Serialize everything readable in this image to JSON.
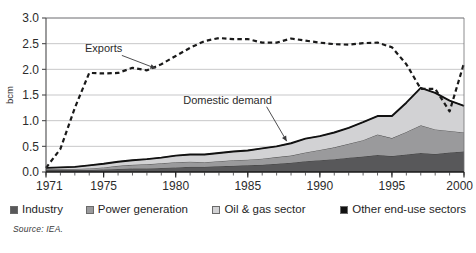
{
  "figure": {
    "source_note": "Source: IEA.",
    "title_partial": ""
  },
  "legend": {
    "items": [
      {
        "label": "Industry",
        "color": "#58585a",
        "swatch_name": "legend-swatch-industry"
      },
      {
        "label": "Power generation",
        "color": "#9a9a9c",
        "swatch_name": "legend-swatch-power-generation"
      },
      {
        "label": "Oil & gas sector",
        "color": "#d2d2d4",
        "swatch_name": "legend-swatch-oil-gas-sector"
      },
      {
        "label": "Other end-use sectors",
        "color": "#111111",
        "swatch_name": "legend-swatch-other-end-use"
      }
    ]
  },
  "chart_data": {
    "type": "area",
    "title": "",
    "xlabel": "",
    "ylabel": "bcm",
    "ylim": [
      0,
      3.0
    ],
    "xlim": [
      1971,
      2000
    ],
    "yticks": [
      "0.0",
      "0.5",
      "1.0",
      "1.5",
      "2.0",
      "2.5",
      "3.0"
    ],
    "ytick_values": [
      0.0,
      0.5,
      1.0,
      1.5,
      2.0,
      2.5,
      3.0
    ],
    "xticks": [
      "1971",
      "1975",
      "1980",
      "1985",
      "1990",
      "1995",
      "2000"
    ],
    "xtick_values": [
      1971,
      1975,
      1980,
      1985,
      1990,
      1995,
      2000
    ],
    "grid": "horizontal",
    "legend_position": "below",
    "stacked": true,
    "x": [
      1971,
      1972,
      1973,
      1974,
      1975,
      1976,
      1977,
      1978,
      1979,
      1980,
      1981,
      1982,
      1983,
      1984,
      1985,
      1986,
      1987,
      1988,
      1989,
      1990,
      1991,
      1992,
      1993,
      1994,
      1995,
      1996,
      1997,
      1998,
      1999,
      2000
    ],
    "series": [
      {
        "name": "Other end-use sectors",
        "color": "#111111",
        "values": [
          0.01,
          0.01,
          0.01,
          0.01,
          0.01,
          0.01,
          0.01,
          0.01,
          0.01,
          0.01,
          0.01,
          0.01,
          0.01,
          0.01,
          0.01,
          0.01,
          0.01,
          0.01,
          0.01,
          0.01,
          0.01,
          0.01,
          0.01,
          0.01,
          0.01,
          0.01,
          0.01,
          0.01,
          0.01,
          0.01
        ]
      },
      {
        "name": "Industry",
        "color": "#58585a",
        "values": [
          0.03,
          0.03,
          0.03,
          0.03,
          0.04,
          0.05,
          0.06,
          0.06,
          0.07,
          0.08,
          0.09,
          0.09,
          0.1,
          0.11,
          0.12,
          0.13,
          0.15,
          0.17,
          0.2,
          0.22,
          0.24,
          0.27,
          0.29,
          0.32,
          0.3,
          0.33,
          0.36,
          0.34,
          0.37,
          0.39
        ]
      },
      {
        "name": "Power generation",
        "color": "#9a9a9c",
        "values": [
          0.02,
          0.02,
          0.02,
          0.03,
          0.04,
          0.06,
          0.07,
          0.08,
          0.09,
          0.1,
          0.1,
          0.09,
          0.1,
          0.11,
          0.11,
          0.12,
          0.13,
          0.14,
          0.17,
          0.2,
          0.23,
          0.27,
          0.32,
          0.4,
          0.35,
          0.44,
          0.54,
          0.48,
          0.42,
          0.37
        ]
      },
      {
        "name": "Oil & gas sector",
        "color": "#d2d2d4",
        "values": [
          0.02,
          0.03,
          0.04,
          0.06,
          0.07,
          0.08,
          0.09,
          0.1,
          0.11,
          0.13,
          0.14,
          0.15,
          0.16,
          0.17,
          0.18,
          0.2,
          0.21,
          0.24,
          0.27,
          0.27,
          0.29,
          0.31,
          0.35,
          0.36,
          0.43,
          0.57,
          0.73,
          0.71,
          0.59,
          0.52
        ]
      }
    ],
    "total_domestic_demand": [
      0.08,
      0.09,
      0.1,
      0.13,
      0.16,
      0.2,
      0.23,
      0.25,
      0.28,
      0.32,
      0.34,
      0.34,
      0.37,
      0.4,
      0.42,
      0.46,
      0.5,
      0.56,
      0.65,
      0.7,
      0.77,
      0.86,
      0.97,
      1.09,
      1.09,
      1.35,
      1.64,
      1.54,
      1.39,
      1.29
    ],
    "exports_line": {
      "name": "Exports",
      "style": "dashed",
      "color": "#1a1a1a",
      "values": [
        0.08,
        0.45,
        1.25,
        1.93,
        1.92,
        1.93,
        2.03,
        1.98,
        2.1,
        2.26,
        2.42,
        2.55,
        2.61,
        2.59,
        2.59,
        2.52,
        2.52,
        2.6,
        2.56,
        2.52,
        2.49,
        2.48,
        2.51,
        2.52,
        2.43,
        2.1,
        1.62,
        1.62,
        1.18,
        2.12
      ]
    },
    "annotations": [
      {
        "text": "Exports",
        "x": 1975.0,
        "y": 2.33,
        "arrow_to_x": 1978.6,
        "arrow_to_y": 2.02
      },
      {
        "text": "Domestic demand",
        "x": 1983.6,
        "y": 1.33,
        "arrow_to_x": 1987.7,
        "arrow_to_y": 0.6
      }
    ]
  }
}
